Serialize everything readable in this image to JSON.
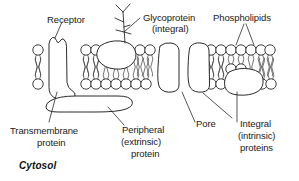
{
  "figure": {
    "background_color": "#ffffff",
    "ink_color": "#2b2b2b"
  },
  "labels": {
    "receptor": "Receptor",
    "glycoprotein_line1": "Glycoprotein",
    "glycoprotein_line2": "(integral)",
    "phospholipids": "Phospholipids",
    "transmembrane_line1": "Transmembrane",
    "transmembrane_line2": "protein",
    "peripheral_line1": "Peripheral",
    "peripheral_line2": "(extrinsic)",
    "peripheral_line3": "protein",
    "pore": "Pore",
    "integral_line1": "Integral",
    "integral_line2": "(intrinsic)",
    "integral_line3": "proteins",
    "cytosol": "Cytosol"
  },
  "structures": {
    "bilayer": {
      "name": "phospholipid-bilayer",
      "upper_head_y": 50,
      "lower_head_y": 84,
      "head_radius": 5.2,
      "left_x": 33,
      "right_x": 272
    },
    "transmembrane_protein": {
      "name": "transmembrane-protein",
      "x": 47,
      "y": 38
    },
    "glycoprotein": {
      "name": "glycoprotein",
      "x": 95,
      "y": 41
    },
    "carbohydrate_chain": {
      "name": "carbohydrate-chain",
      "x": 122,
      "y": 12
    },
    "pore_protein_left": {
      "name": "integral-protein-pore-left",
      "x": 156,
      "y": 42
    },
    "pore_protein_right": {
      "name": "integral-protein-pore-right",
      "x": 186,
      "y": 42
    },
    "integral_protein_lower": {
      "name": "integral-protein-lower-right",
      "x": 225,
      "y": 79
    },
    "peripheral_protein": {
      "name": "peripheral-protein",
      "x": 45,
      "y": 95
    }
  }
}
